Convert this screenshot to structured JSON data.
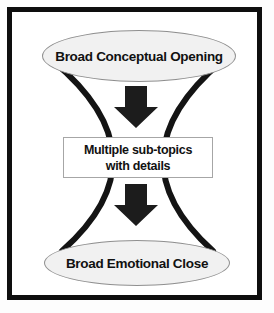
{
  "diagram": {
    "type": "hourglass-flow",
    "opening": {
      "shape": "ellipse",
      "label": "Broad Conceptual Opening"
    },
    "arrow1": {
      "icon": "down-arrow"
    },
    "subtopics": {
      "shape": "rectangle",
      "line1": "Multiple sub-topics",
      "line2": "with details"
    },
    "arrow2": {
      "icon": "down-arrow"
    },
    "close": {
      "shape": "ellipse",
      "label": "Broad Emotional Close"
    }
  },
  "colors": {
    "frame": "#0e0e0e",
    "curve": "#141414",
    "arrow": "#1c1c1c",
    "ellipse_fill": "#f1f1f1",
    "ellipse_stroke": "#8f8f8f",
    "box_fill": "#ffffff",
    "box_stroke": "#a6a6a6",
    "text": "#111111",
    "background": "#ffffff"
  }
}
